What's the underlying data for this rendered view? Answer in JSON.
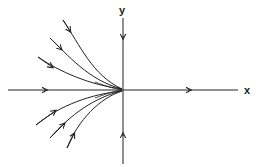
{
  "diagram": {
    "type": "phase portrait",
    "axes": {
      "x_label": "x",
      "y_label": "y"
    },
    "colors": {
      "stroke": "#222222",
      "background": "#ffffff"
    },
    "trajectories": [
      {
        "name": "positive-x-axis",
        "direction": "outward from origin"
      },
      {
        "name": "negative-x-axis",
        "direction": "toward origin"
      },
      {
        "name": "positive-y-axis",
        "direction": "toward origin"
      },
      {
        "name": "negative-y-axis",
        "direction": "toward origin"
      },
      {
        "name": "upper-curve-1",
        "direction": "toward origin"
      },
      {
        "name": "upper-curve-2",
        "direction": "toward origin"
      },
      {
        "name": "upper-curve-3",
        "direction": "toward origin"
      },
      {
        "name": "lower-curve-1",
        "direction": "toward origin"
      },
      {
        "name": "lower-curve-2",
        "direction": "toward origin"
      },
      {
        "name": "lower-curve-3",
        "direction": "toward origin"
      }
    ]
  }
}
